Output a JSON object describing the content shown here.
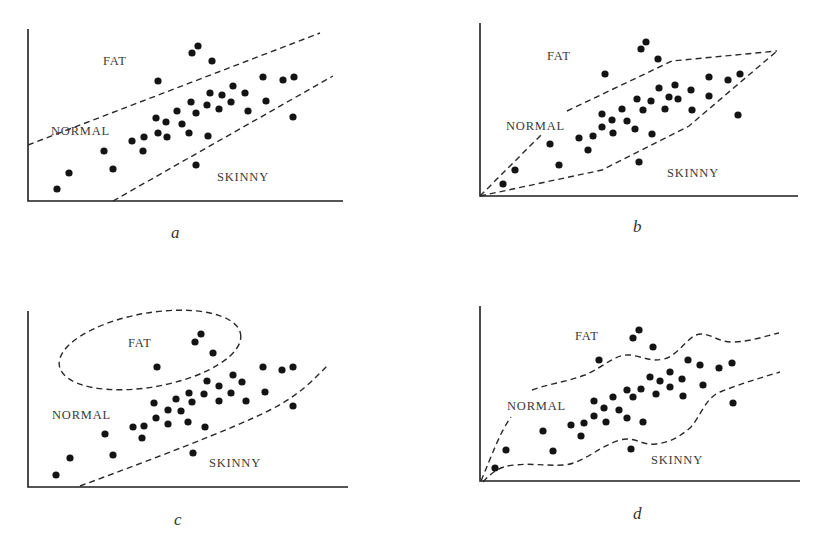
{
  "figure": {
    "colors": {
      "background": "#ffffff",
      "ink": "#141414",
      "label": "#3a3a3a"
    }
  },
  "chart_data": [
    {
      "type": "scatter",
      "panel": "a",
      "caption": "a",
      "title": "",
      "xlabel": "",
      "ylabel": "",
      "grid": false,
      "description": "Linear (parallel straight-line) decision boundaries separating FAT / NORMAL / SKINNY",
      "labels": [
        {
          "text": "FAT",
          "x": 103,
          "y": 65
        },
        {
          "text": "NORMAL",
          "x": 51,
          "y": 135
        },
        {
          "text": "SKINNY",
          "x": 217,
          "y": 181
        }
      ],
      "caption_pos": {
        "x": 171,
        "y": 238
      },
      "axes": {
        "origin": [
          28,
          201
        ],
        "y_top": 29,
        "x_end": 343
      },
      "boundaries": [
        {
          "name": "fat-normal-boundary",
          "path": "M28,145 L320,33"
        },
        {
          "name": "normal-skinny-boundary",
          "path": "M113,201 L333,76"
        }
      ],
      "points": [
        [
          57,
          189
        ],
        [
          69,
          173
        ],
        [
          104,
          151
        ],
        [
          113,
          169
        ],
        [
          132,
          141
        ],
        [
          144,
          137
        ],
        [
          143,
          151
        ],
        [
          156,
          118
        ],
        [
          166,
          122
        ],
        [
          158,
          133
        ],
        [
          167,
          137
        ],
        [
          158,
          81
        ],
        [
          177,
          111
        ],
        [
          182,
          124
        ],
        [
          189,
          133
        ],
        [
          191,
          102
        ],
        [
          196,
          113
        ],
        [
          192,
          53
        ],
        [
          198,
          46
        ],
        [
          212,
          61
        ],
        [
          207,
          105
        ],
        [
          208,
          136
        ],
        [
          196,
          165
        ],
        [
          210,
          93
        ],
        [
          219,
          109
        ],
        [
          222,
          95
        ],
        [
          231,
          102
        ],
        [
          233,
          86
        ],
        [
          245,
          93
        ],
        [
          248,
          111
        ],
        [
          263,
          77
        ],
        [
          266,
          101
        ],
        [
          283,
          80
        ],
        [
          294,
          77
        ],
        [
          293,
          117
        ]
      ]
    },
    {
      "type": "scatter",
      "panel": "b",
      "caption": "b",
      "title": "",
      "xlabel": "",
      "ylabel": "",
      "grid": false,
      "description": "Piecewise-linear (polygonal) NORMAL region",
      "labels": [
        {
          "text": "FAT",
          "x": 547,
          "y": 60
        },
        {
          "text": "NORMAL",
          "x": 506,
          "y": 130
        },
        {
          "text": "SKINNY",
          "x": 667,
          "y": 177
        }
      ],
      "caption_pos": {
        "x": 633,
        "y": 232
      },
      "axes": {
        "origin": [
          480,
          196
        ],
        "y_top": 23,
        "x_end": 798
      },
      "boundaries": [
        {
          "name": "upper-polygon-boundary",
          "path": "M480,196 L543,133 M567,111 L672,61 L777,51"
        },
        {
          "name": "lower-polygon-boundary",
          "path": "M480,196 L602,170 L689,126 L777,51"
        }
      ],
      "points": [
        [
          503,
          184
        ],
        [
          515,
          170
        ],
        [
          550,
          144
        ],
        [
          559,
          165
        ],
        [
          579,
          138
        ],
        [
          588,
          150
        ],
        [
          593,
          136
        ],
        [
          602,
          114
        ],
        [
          602,
          127
        ],
        [
          605,
          74
        ],
        [
          612,
          120
        ],
        [
          613,
          133
        ],
        [
          622,
          109
        ],
        [
          627,
          121
        ],
        [
          635,
          129
        ],
        [
          637,
          99
        ],
        [
          643,
          110
        ],
        [
          641,
          49
        ],
        [
          646,
          42
        ],
        [
          651,
          101
        ],
        [
          652,
          134
        ],
        [
          639,
          162
        ],
        [
          658,
          59
        ],
        [
          659,
          88
        ],
        [
          665,
          109
        ],
        [
          669,
          97
        ],
        [
          675,
          85
        ],
        [
          678,
          99
        ],
        [
          691,
          90
        ],
        [
          692,
          110
        ],
        [
          709,
          77
        ],
        [
          709,
          96
        ],
        [
          728,
          80
        ],
        [
          740,
          74
        ],
        [
          738,
          115
        ]
      ]
    },
    {
      "type": "scatter",
      "panel": "c",
      "caption": "c",
      "title": "",
      "xlabel": "",
      "ylabel": "",
      "grid": false,
      "description": "Elliptical FAT region and a curved NORMAL/SKINNY boundary",
      "labels": [
        {
          "text": "FAT",
          "x": 128,
          "y": 347
        },
        {
          "text": "NORMAL",
          "x": 52,
          "y": 419
        },
        {
          "text": "SKINNY",
          "x": 209,
          "y": 467
        }
      ],
      "caption_pos": {
        "x": 174,
        "y": 525
      },
      "axes": {
        "origin": [
          28,
          487
        ],
        "y_top": 311,
        "x_end": 348
      },
      "ellipse": {
        "cx": 150,
        "cy": 350,
        "rx": 92,
        "ry": 37,
        "rotate": -10
      },
      "boundaries": [
        {
          "name": "normal-skinny-curve",
          "path": "M80,486 C150,460 230,430 270,410 C300,395 315,378 328,365"
        }
      ],
      "points": [
        [
          56,
          475
        ],
        [
          70,
          458
        ],
        [
          105,
          434
        ],
        [
          113,
          455
        ],
        [
          133,
          427
        ],
        [
          144,
          426
        ],
        [
          142,
          438
        ],
        [
          154,
          403
        ],
        [
          156,
          418
        ],
        [
          157,
          367
        ],
        [
          168,
          410
        ],
        [
          168,
          424
        ],
        [
          176,
          399
        ],
        [
          181,
          411
        ],
        [
          188,
          422
        ],
        [
          189,
          393
        ],
        [
          192,
          402
        ],
        [
          195,
          342
        ],
        [
          201,
          334
        ],
        [
          204,
          394
        ],
        [
          205,
          427
        ],
        [
          193,
          453
        ],
        [
          207,
          381
        ],
        [
          213,
          353
        ],
        [
          219,
          386
        ],
        [
          219,
          401
        ],
        [
          231,
          393
        ],
        [
          233,
          375
        ],
        [
          242,
          382
        ],
        [
          246,
          401
        ],
        [
          263,
          367
        ],
        [
          265,
          392
        ],
        [
          282,
          370
        ],
        [
          293,
          367
        ],
        [
          293,
          406
        ]
      ]
    },
    {
      "type": "scatter",
      "panel": "d",
      "caption": "d",
      "title": "",
      "xlabel": "",
      "ylabel": "",
      "grid": false,
      "description": "Highly non-linear (wavy) boundaries overfitting the data",
      "labels": [
        {
          "text": "FAT",
          "x": 575,
          "y": 340
        },
        {
          "text": "NORMAL",
          "x": 507,
          "y": 410
        },
        {
          "text": "SKINNY",
          "x": 651,
          "y": 464
        }
      ],
      "caption_pos": {
        "x": 633,
        "y": 519
      },
      "axes": {
        "origin": [
          480,
          481
        ],
        "y_top": 306,
        "x_end": 800
      },
      "boundaries": [
        {
          "name": "upper-wavy-boundary",
          "path": "M481,481 C492,455 500,432 511,417 M532,390 C548,384 566,382 585,375 C605,366 615,354 630,355 C645,357 650,362 664,359 C680,355 688,334 701,334 C712,334 718,342 732,342 C750,342 765,336 779,333"
        },
        {
          "name": "lower-wavy-boundary",
          "path": "M483,482 C492,472 500,466 515,465 C530,463 545,466 565,465 C585,462 598,447 620,440 C635,436 642,446 656,444 C670,442 678,438 690,428 C700,418 705,398 720,392 C740,384 760,378 780,372"
        }
      ],
      "points": [
        [
          495,
          468
        ],
        [
          506,
          450
        ],
        [
          543,
          431
        ],
        [
          553,
          451
        ],
        [
          571,
          425
        ],
        [
          584,
          423
        ],
        [
          581,
          436
        ],
        [
          594,
          401
        ],
        [
          594,
          416
        ],
        [
          599,
          360
        ],
        [
          604,
          408
        ],
        [
          606,
          422
        ],
        [
          613,
          397
        ],
        [
          619,
          410
        ],
        [
          627,
          390
        ],
        [
          627,
          418
        ],
        [
          633,
          397
        ],
        [
          633,
          338
        ],
        [
          639,
          330
        ],
        [
          641,
          389
        ],
        [
          643,
          422
        ],
        [
          631,
          449
        ],
        [
          650,
          377
        ],
        [
          653,
          347
        ],
        [
          656,
          394
        ],
        [
          660,
          381
        ],
        [
          670,
          372
        ],
        [
          670,
          387
        ],
        [
          682,
          379
        ],
        [
          683,
          396
        ],
        [
          688,
          360
        ],
        [
          700,
          365
        ],
        [
          703,
          385
        ],
        [
          719,
          368
        ],
        [
          732,
          363
        ],
        [
          733,
          403
        ]
      ]
    }
  ]
}
